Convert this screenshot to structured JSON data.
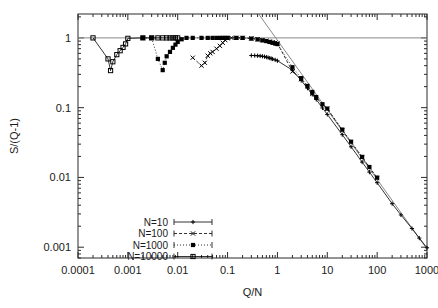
{
  "chart_data": {
    "type": "scatter",
    "title": "",
    "xlabel": "Q/N",
    "ylabel": "S/(Q-1)",
    "xscale": "log",
    "yscale": "log",
    "xlim": [
      0.0001,
      1000
    ],
    "ylim": [
      0.0007,
      2.2
    ],
    "xticks": [
      "0.0001",
      "0.001",
      "0.01",
      "0.1",
      "1",
      "10",
      "100",
      "1000"
    ],
    "xtick_values": [
      0.0001,
      0.001,
      0.01,
      0.1,
      1,
      10,
      100,
      1000
    ],
    "yticks": [
      "1",
      "0.1",
      "0.01",
      "0.001"
    ],
    "ytick_values": [
      1,
      0.1,
      0.01,
      0.001
    ],
    "grid": false,
    "legend_position": "lower-left",
    "reference_lines": [
      {
        "name": "unity-line",
        "type": "horizontal",
        "y": 1
      },
      {
        "name": "power-law-guide",
        "type": "power",
        "slope": -1,
        "x0": 0.42,
        "y0": 2.2,
        "x1": 1000,
        "y1": 0.00094
      }
    ],
    "series": [
      {
        "name": "N=10",
        "marker": "plus",
        "line": "solid",
        "points": [
          [
            0.3,
            0.56
          ],
          [
            0.35,
            0.558
          ],
          [
            0.4,
            0.555
          ],
          [
            0.45,
            0.551
          ],
          [
            0.5,
            0.545
          ],
          [
            0.55,
            0.538
          ],
          [
            0.6,
            0.53
          ],
          [
            0.65,
            0.522
          ],
          [
            0.7,
            0.514
          ],
          [
            0.75,
            0.506
          ],
          [
            0.8,
            0.498
          ],
          [
            0.9,
            0.484
          ],
          [
            1.0,
            0.47
          ],
          [
            2.0,
            0.345
          ],
          [
            3.0,
            0.245
          ],
          [
            4.0,
            0.19
          ],
          [
            5.0,
            0.155
          ],
          [
            6.0,
            0.131
          ],
          [
            8.0,
            0.099
          ],
          [
            10.0,
            0.08
          ],
          [
            20.0,
            0.041
          ],
          [
            30.0,
            0.0275
          ],
          [
            50.0,
            0.0166
          ],
          [
            70.0,
            0.0119
          ],
          [
            100.0,
            0.0084
          ],
          [
            200.0,
            0.0042
          ],
          [
            300.0,
            0.0029
          ],
          [
            500.0,
            0.00185
          ],
          [
            700.0,
            0.00135
          ],
          [
            1000.0,
            0.00098
          ]
        ]
      },
      {
        "name": "N=100",
        "marker": "cross",
        "line": "dashed",
        "points": [
          [
            0.02,
            0.52
          ],
          [
            0.03,
            0.4
          ],
          [
            0.035,
            0.44
          ],
          [
            0.04,
            0.555
          ],
          [
            0.045,
            0.6
          ],
          [
            0.05,
            0.63
          ],
          [
            0.06,
            0.7
          ],
          [
            0.07,
            0.77
          ],
          [
            0.08,
            0.85
          ],
          [
            0.09,
            0.93
          ],
          [
            0.1,
            0.985
          ],
          [
            0.12,
            1.0
          ],
          [
            0.15,
            1.0
          ],
          [
            0.2,
            1.0
          ],
          [
            0.3,
            0.985
          ],
          [
            0.4,
            0.955
          ],
          [
            0.5,
            0.93
          ],
          [
            0.6,
            0.91
          ],
          [
            0.7,
            0.885
          ],
          [
            0.8,
            0.865
          ],
          [
            0.9,
            0.85
          ],
          [
            1.0,
            0.835
          ],
          [
            2.0,
            0.33
          ],
          [
            3.0,
            0.255
          ],
          [
            5.0,
            0.157
          ],
          [
            10.0,
            0.0965
          ],
          [
            20.0,
            0.0475
          ],
          [
            50.0,
            0.0195
          ],
          [
            100.0,
            0.0098
          ]
        ]
      },
      {
        "name": "N=1000",
        "marker": "fsquare",
        "line": "dotted",
        "points": [
          [
            0.002,
            1.0
          ],
          [
            0.003,
            1.0
          ],
          [
            0.004,
            0.5
          ],
          [
            0.005,
            0.345
          ],
          [
            0.0055,
            0.44
          ],
          [
            0.006,
            0.545
          ],
          [
            0.007,
            0.63
          ],
          [
            0.008,
            0.72
          ],
          [
            0.009,
            0.8
          ],
          [
            0.01,
            0.875
          ],
          [
            0.012,
            0.955
          ],
          [
            0.015,
            1.0
          ],
          [
            0.02,
            1.0
          ],
          [
            0.03,
            1.0
          ],
          [
            0.04,
            1.0
          ],
          [
            0.05,
            1.0
          ],
          [
            0.06,
            1.0
          ],
          [
            0.07,
            1.0
          ],
          [
            0.08,
            1.0
          ],
          [
            0.09,
            1.0
          ],
          [
            0.1,
            1.0
          ],
          [
            0.15,
            1.0
          ],
          [
            0.2,
            1.0
          ],
          [
            0.3,
            0.975
          ],
          [
            0.4,
            0.95
          ],
          [
            0.5,
            0.92
          ],
          [
            0.6,
            0.9
          ],
          [
            0.7,
            0.875
          ],
          [
            0.8,
            0.85
          ],
          [
            0.9,
            0.83
          ],
          [
            1.0,
            0.815
          ],
          [
            2.0,
            0.38
          ],
          [
            3.0,
            0.265
          ],
          [
            4.0,
            0.205
          ],
          [
            5.0,
            0.168
          ],
          [
            6.0,
            0.142
          ],
          [
            8.0,
            0.112
          ],
          [
            10.0,
            0.097
          ],
          [
            20.0,
            0.0485
          ],
          [
            30.0,
            0.0325
          ],
          [
            50.0,
            0.0197
          ],
          [
            70.0,
            0.0141
          ],
          [
            100.0,
            0.00995
          ]
        ]
      },
      {
        "name": "N=10000",
        "marker": "osquare",
        "line": "solid",
        "points": [
          [
            0.0002,
            1.0
          ],
          [
            0.0004,
            0.5
          ],
          [
            0.00045,
            0.34
          ],
          [
            0.0005,
            0.455
          ],
          [
            0.0006,
            0.575
          ],
          [
            0.0007,
            0.655
          ],
          [
            0.0008,
            0.73
          ],
          [
            0.0009,
            0.82
          ],
          [
            0.001,
            0.985
          ],
          [
            0.002,
            1.0
          ],
          [
            0.003,
            1.0
          ],
          [
            0.004,
            1.0
          ],
          [
            0.005,
            1.0
          ],
          [
            0.006,
            1.0
          ],
          [
            0.007,
            1.0
          ],
          [
            0.008,
            1.0
          ],
          [
            0.009,
            1.0
          ],
          [
            0.01,
            1.0
          ]
        ]
      }
    ]
  },
  "legend": {
    "entries": [
      {
        "label": "N=10"
      },
      {
        "label": "N=100"
      },
      {
        "label": "N=1000"
      },
      {
        "label": "N=10000"
      }
    ]
  },
  "colors": {
    "axis": "#2b2b2b",
    "text": "#1a1a1a",
    "data": "#000000",
    "guide": "#888888",
    "background": "#ffffff"
  }
}
